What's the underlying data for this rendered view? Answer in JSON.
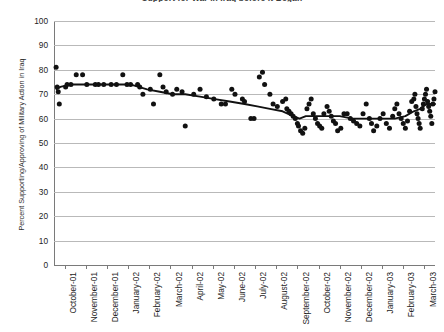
{
  "chart_data": {
    "type": "scatter",
    "title": "Support for War in Iraq before it Began",
    "xlabel": "",
    "ylabel": "Percent Supporting/Approving of Military Action in Iraq",
    "ylim": [
      0,
      100
    ],
    "ytick_step": 10,
    "yticks": [
      100,
      90,
      80,
      70,
      60,
      50,
      40,
      30,
      20,
      10,
      0
    ],
    "grid": true,
    "legend": "none",
    "marker_color": "#111111",
    "line_color": "#111111",
    "gridline_color": "#b9b9b9",
    "axis_color": "#7a7a7a",
    "categories": [
      "October-01",
      "November-01",
      "December-01",
      "January-02",
      "February-02",
      "March-02",
      "April-02",
      "May-02",
      "June-02",
      "July-02",
      "August-02",
      "September-02",
      "October-02",
      "November-02",
      "December-02",
      "January-03",
      "February-03",
      "March-03"
    ],
    "xlim_months": [
      0,
      18
    ],
    "series": [
      {
        "name": "Poll results",
        "type": "scatter",
        "points": [
          [
            0.1,
            81
          ],
          [
            0.15,
            73
          ],
          [
            0.2,
            71
          ],
          [
            0.25,
            66
          ],
          [
            0.55,
            73
          ],
          [
            0.62,
            74
          ],
          [
            0.8,
            74
          ],
          [
            1.05,
            78
          ],
          [
            1.35,
            78
          ],
          [
            1.55,
            74
          ],
          [
            1.95,
            74
          ],
          [
            2.1,
            74
          ],
          [
            2.35,
            74
          ],
          [
            2.7,
            74
          ],
          [
            2.95,
            74
          ],
          [
            3.25,
            78
          ],
          [
            3.45,
            74
          ],
          [
            3.62,
            74
          ],
          [
            3.95,
            74
          ],
          [
            4.05,
            73
          ],
          [
            4.2,
            70
          ],
          [
            4.55,
            72
          ],
          [
            4.7,
            66
          ],
          [
            5.0,
            78
          ],
          [
            5.15,
            73
          ],
          [
            5.3,
            71
          ],
          [
            5.6,
            70
          ],
          [
            5.8,
            72
          ],
          [
            6.05,
            71
          ],
          [
            6.2,
            57
          ],
          [
            6.6,
            70
          ],
          [
            6.9,
            72
          ],
          [
            7.2,
            69
          ],
          [
            7.55,
            68
          ],
          [
            7.9,
            66
          ],
          [
            8.1,
            66
          ],
          [
            8.4,
            72
          ],
          [
            8.55,
            70
          ],
          [
            8.9,
            68
          ],
          [
            9.0,
            67
          ],
          [
            9.3,
            60
          ],
          [
            9.45,
            60
          ],
          [
            9.7,
            77
          ],
          [
            9.85,
            79
          ],
          [
            9.95,
            74
          ],
          [
            10.2,
            70
          ],
          [
            10.35,
            66
          ],
          [
            10.55,
            65
          ],
          [
            10.8,
            67
          ],
          [
            10.95,
            68
          ],
          [
            11.0,
            64
          ],
          [
            11.1,
            63
          ],
          [
            11.2,
            62
          ],
          [
            11.3,
            61
          ],
          [
            11.4,
            60
          ],
          [
            11.5,
            58
          ],
          [
            11.55,
            57
          ],
          [
            11.65,
            55
          ],
          [
            11.75,
            54
          ],
          [
            11.85,
            56
          ],
          [
            11.95,
            64
          ],
          [
            12.05,
            66
          ],
          [
            12.15,
            68
          ],
          [
            12.25,
            62
          ],
          [
            12.35,
            60
          ],
          [
            12.45,
            58
          ],
          [
            12.55,
            57
          ],
          [
            12.65,
            56
          ],
          [
            12.75,
            62
          ],
          [
            12.9,
            65
          ],
          [
            13.0,
            63
          ],
          [
            13.1,
            61
          ],
          [
            13.2,
            59
          ],
          [
            13.3,
            58
          ],
          [
            13.4,
            55
          ],
          [
            13.55,
            56
          ],
          [
            13.7,
            62
          ],
          [
            13.85,
            62
          ],
          [
            14.0,
            60
          ],
          [
            14.15,
            59
          ],
          [
            14.3,
            58
          ],
          [
            14.45,
            57
          ],
          [
            14.6,
            62
          ],
          [
            14.75,
            66
          ],
          [
            14.9,
            60
          ],
          [
            15.0,
            58
          ],
          [
            15.1,
            55
          ],
          [
            15.25,
            57
          ],
          [
            15.4,
            60
          ],
          [
            15.55,
            62
          ],
          [
            15.7,
            58
          ],
          [
            15.85,
            56
          ],
          [
            16.0,
            61
          ],
          [
            16.1,
            64
          ],
          [
            16.2,
            66
          ],
          [
            16.3,
            62
          ],
          [
            16.4,
            60
          ],
          [
            16.5,
            58
          ],
          [
            16.6,
            56
          ],
          [
            16.7,
            59
          ],
          [
            16.8,
            63
          ],
          [
            16.9,
            67
          ],
          [
            17.0,
            68
          ],
          [
            17.05,
            70
          ],
          [
            17.1,
            65
          ],
          [
            17.15,
            62
          ],
          [
            17.2,
            60
          ],
          [
            17.25,
            58
          ],
          [
            17.3,
            56
          ],
          [
            17.4,
            64
          ],
          [
            17.45,
            66
          ],
          [
            17.5,
            68
          ],
          [
            17.55,
            70
          ],
          [
            17.6,
            72
          ],
          [
            17.65,
            67
          ],
          [
            17.7,
            65
          ],
          [
            17.75,
            63
          ],
          [
            17.8,
            61
          ],
          [
            17.85,
            58
          ],
          [
            17.9,
            66
          ],
          [
            17.95,
            68
          ],
          [
            18.0,
            71
          ]
        ]
      },
      {
        "name": "Trend",
        "type": "line",
        "points": [
          [
            0.12,
            72
          ],
          [
            0.3,
            73
          ],
          [
            0.8,
            74
          ],
          [
            1.4,
            74
          ],
          [
            2.1,
            74
          ],
          [
            2.9,
            74
          ],
          [
            3.6,
            74
          ],
          [
            4.0,
            73
          ],
          [
            4.4,
            72
          ],
          [
            5.0,
            71
          ],
          [
            5.6,
            70
          ],
          [
            6.2,
            70
          ],
          [
            6.9,
            69
          ],
          [
            7.6,
            68
          ],
          [
            8.3,
            67
          ],
          [
            9.0,
            66
          ],
          [
            9.6,
            65
          ],
          [
            10.2,
            64
          ],
          [
            10.8,
            63
          ],
          [
            11.3,
            61
          ],
          [
            11.6,
            60
          ],
          [
            11.9,
            61
          ],
          [
            12.3,
            61
          ],
          [
            12.9,
            61
          ],
          [
            13.5,
            61
          ],
          [
            14.1,
            60
          ],
          [
            14.7,
            60
          ],
          [
            15.2,
            60
          ],
          [
            15.7,
            60
          ],
          [
            16.1,
            60
          ],
          [
            16.6,
            61
          ],
          [
            17.0,
            63
          ],
          [
            17.3,
            64
          ],
          [
            17.6,
            66
          ],
          [
            18.0,
            66
          ]
        ]
      }
    ]
  }
}
